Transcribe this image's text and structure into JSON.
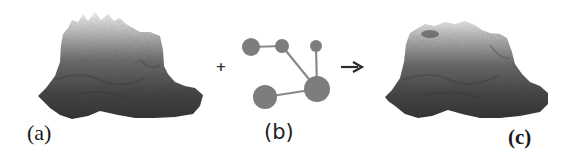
{
  "figure": {
    "panels": [
      {
        "id": "a",
        "label": "(a)",
        "description": "input terrain heightmap (3D rendering)"
      },
      {
        "id": "b",
        "label": "(b)",
        "description": "graph of nodes and edges"
      },
      {
        "id": "c",
        "label": "(c)",
        "description": "output terrain heightmap (3D rendering)"
      }
    ],
    "operators": {
      "plus": "+",
      "arrow": "→"
    },
    "graph": {
      "nodes": [
        {
          "id": "n1",
          "cx": 251,
          "cy": 47,
          "r": 9
        },
        {
          "id": "n2",
          "cx": 282,
          "cy": 46,
          "r": 7
        },
        {
          "id": "n3",
          "cx": 316,
          "cy": 46,
          "r": 6
        },
        {
          "id": "n4",
          "cx": 317,
          "cy": 89,
          "r": 13
        },
        {
          "id": "n5",
          "cx": 265,
          "cy": 97,
          "r": 12
        }
      ],
      "edges": [
        {
          "from": "n1",
          "to": "n2"
        },
        {
          "from": "n2",
          "to": "n4"
        },
        {
          "from": "n3",
          "to": "n4"
        },
        {
          "from": "n5",
          "to": "n4"
        }
      ]
    },
    "colors": {
      "node": "#7d7d7d",
      "edge": "#8a8a8a",
      "terrain_top": "#d6d6d6",
      "terrain_mid": "#7a7a7a",
      "terrain_bottom": "#3a3a3a",
      "text": "#1a1a1a"
    }
  }
}
